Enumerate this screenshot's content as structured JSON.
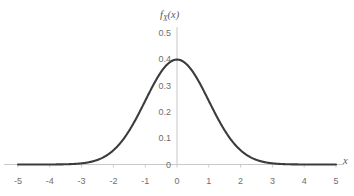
{
  "figure": {
    "background_color": "#ffffff",
    "width": 354,
    "height": 196
  },
  "axis_titles": {
    "y_symbol": "f",
    "y_subscript": "X",
    "y_argument": "(x)",
    "x_label": "x"
  },
  "style": {
    "curve_color": "#3c3c3c",
    "axis_color": "#c8c8c8",
    "tick_color": "#cccccc",
    "label_color": "#6e6e6e",
    "curve_width": 2.1
  },
  "chart_data": {
    "type": "line",
    "title": "",
    "subtitle": "",
    "xlabel": "x",
    "ylabel": "f_X(x)",
    "legend": [],
    "legend_position": "none",
    "grid": false,
    "xlim": [
      -5,
      5
    ],
    "ylim": [
      0,
      0.5
    ],
    "xticks": [
      -5,
      -4,
      -3,
      -2,
      -1,
      0,
      1,
      2,
      3,
      4,
      5
    ],
    "xtick_labels": [
      "-5",
      "-4",
      "-3",
      "-2",
      "-1",
      "0",
      "1",
      "2",
      "3",
      "4",
      "5"
    ],
    "yticks": [
      0,
      0.1,
      0.2,
      0.3,
      0.4,
      0.5
    ],
    "ytick_labels": [
      "0",
      "0.1",
      "0.2",
      "0.3",
      "0.4",
      "0.5"
    ],
    "series": [
      {
        "name": "standard normal pdf",
        "formula": "(1/sqrt(2*pi))*exp(-x^2/2)",
        "mean": 0,
        "stddev": 1,
        "peak_value": 0.3989,
        "peak_x": 0,
        "x": [
          -5,
          -4.75,
          -4.5,
          -4.25,
          -4,
          -3.75,
          -3.5,
          -3.25,
          -3,
          -2.75,
          -2.5,
          -2.25,
          -2,
          -1.75,
          -1.5,
          -1.25,
          -1,
          -0.75,
          -0.5,
          -0.25,
          0,
          0.25,
          0.5,
          0.75,
          1,
          1.25,
          1.5,
          1.75,
          2,
          2.25,
          2.5,
          2.75,
          3,
          3.25,
          3.5,
          3.75,
          4,
          4.25,
          4.5,
          4.75,
          5
        ],
        "values": [
          1.5e-06,
          5.1e-06,
          1.6e-05,
          4.65e-05,
          0.0001338,
          0.0003547,
          0.0008727,
          0.0019867,
          0.0044318,
          0.0090936,
          0.0175283,
          0.0316963,
          0.053991,
          0.0862773,
          0.1295176,
          0.1826491,
          0.2419707,
          0.3011374,
          0.3520653,
          0.3866681,
          0.3989423,
          0.3866681,
          0.3520653,
          0.3011374,
          0.2419707,
          0.1826491,
          0.1295176,
          0.0862773,
          0.053991,
          0.0316963,
          0.0175283,
          0.0090936,
          0.0044318,
          0.0019867,
          0.0008727,
          0.0003547,
          0.0001338,
          4.65e-05,
          1.6e-05,
          5.1e-06,
          1.5e-06
        ]
      }
    ]
  }
}
